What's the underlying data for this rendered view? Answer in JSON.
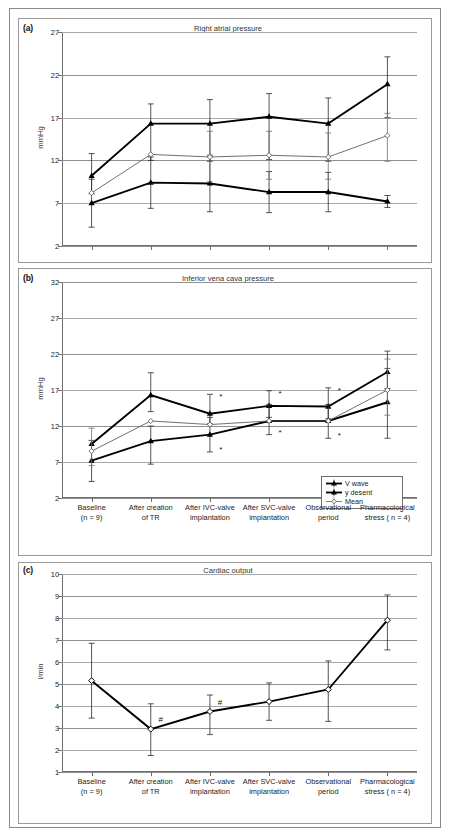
{
  "figure": {
    "panel_a_tag": "(a)",
    "panel_b_tag": "(b)",
    "panel_c_tag": "(c)"
  },
  "categories": [
    {
      "line1": "Baseline",
      "line2": "(n = 9)"
    },
    {
      "line1": "After creation",
      "line2": "of TR"
    },
    {
      "line1": "After IVC-valve",
      "line2": "implantation"
    },
    {
      "line1": "After SVC-valve",
      "line2": "implantation"
    },
    {
      "line1": "Observational",
      "line2": "period"
    },
    {
      "line1": "Pharmacological",
      "line2": "stress ( n = 4)"
    }
  ],
  "legend": {
    "items": [
      {
        "label": "V wave",
        "marker": "filled-triangle",
        "color": "#000000"
      },
      {
        "label": "y desent",
        "marker": "filled-triangle",
        "color": "#000000"
      },
      {
        "label": "Mean",
        "marker": "open-diamond",
        "color": "#555555"
      }
    ]
  },
  "chart_data": [
    {
      "type": "line",
      "panel": "a",
      "title": "Right atrial pressure",
      "xlabel": "",
      "ylabel": "mmHg",
      "ylim": [
        2,
        27
      ],
      "yticks": [
        2,
        7,
        12,
        17,
        22,
        27
      ],
      "grid": true,
      "legend_position": "none",
      "categories": [
        "Baseline (n = 9)",
        "After creation of TR",
        "After IVC-valve implantation",
        "After SVC-valve implantation",
        "Observational period",
        "Pharmacological stress ( n = 4)"
      ],
      "series": [
        {
          "name": "V wave",
          "values": [
            10.2,
            16.3,
            16.3,
            17.1,
            16.3,
            20.9
          ],
          "err_low": [
            8.1,
            12.0,
            11.9,
            12.1,
            11.9,
            17.0
          ],
          "err_high": [
            12.8,
            18.6,
            19.1,
            19.8,
            19.3,
            24.1
          ]
        },
        {
          "name": "y desent",
          "values": [
            7.0,
            9.4,
            9.3,
            8.3,
            8.3,
            7.2
          ],
          "err_low": [
            4.2,
            6.4,
            6.0,
            5.9,
            6.0,
            6.5
          ],
          "err_high": [
            9.8,
            12.4,
            12.6,
            10.7,
            10.6,
            7.9
          ]
        },
        {
          "name": "Mean",
          "values": [
            8.2,
            12.7,
            12.4,
            12.6,
            12.4,
            14.9
          ],
          "err_low": [
            8.2,
            12.7,
            9.5,
            9.8,
            9.8,
            11.9
          ],
          "err_high": [
            8.2,
            12.7,
            15.4,
            15.4,
            15.2,
            17.5
          ]
        }
      ],
      "annotations": []
    },
    {
      "type": "line",
      "panel": "b",
      "title": "Inferior vena cava pressure",
      "xlabel": "",
      "ylabel": "mmHg",
      "ylim": [
        2,
        32
      ],
      "yticks": [
        2,
        7,
        12,
        17,
        22,
        27,
        32
      ],
      "grid": true,
      "legend_position": "bottom-right",
      "categories": [
        "Baseline (n = 9)",
        "After creation of TR",
        "After IVC-valve implantation",
        "After SVC-valve implantation",
        "Observational period",
        "Pharmacological stress ( n = 4)"
      ],
      "series": [
        {
          "name": "V wave",
          "values": [
            9.5,
            16.3,
            13.7,
            14.8,
            14.7,
            19.5
          ],
          "err_low": [
            9.5,
            14.0,
            12.3,
            13.2,
            13.0,
            17.2
          ],
          "err_high": [
            9.5,
            19.4,
            16.4,
            16.9,
            17.3,
            22.4
          ]
        },
        {
          "name": "y desent",
          "values": [
            7.2,
            9.9,
            10.8,
            12.7,
            12.7,
            15.3
          ],
          "err_low": [
            4.3,
            6.7,
            8.4,
            10.8,
            10.3,
            10.3
          ],
          "err_high": [
            10.0,
            12.0,
            13.2,
            15.0,
            15.0,
            20.0
          ]
        },
        {
          "name": "Mean",
          "values": [
            8.5,
            12.7,
            12.2,
            12.7,
            12.7,
            17.0
          ],
          "err_low": [
            6.5,
            12.7,
            12.2,
            12.7,
            12.7,
            13.5
          ],
          "err_high": [
            11.7,
            12.7,
            12.2,
            12.7,
            12.7,
            21.3
          ]
        }
      ],
      "annotations": [
        {
          "symbol": "*",
          "category_index": 2,
          "position": "above"
        },
        {
          "symbol": "*",
          "category_index": 3,
          "position": "above"
        },
        {
          "symbol": "*",
          "category_index": 3,
          "position": "below"
        },
        {
          "symbol": "*",
          "category_index": 4,
          "position": "above"
        },
        {
          "symbol": "*",
          "category_index": 4,
          "position": "below"
        },
        {
          "symbol": "*",
          "category_index": 2,
          "position": "below"
        }
      ]
    },
    {
      "type": "line",
      "panel": "c",
      "title": "Cardiac output",
      "xlabel": "",
      "ylabel": "l/min",
      "ylim": [
        1,
        10
      ],
      "yticks": [
        1,
        2,
        3,
        4,
        5,
        6,
        7,
        8,
        9,
        10
      ],
      "grid": true,
      "legend_position": "none",
      "categories": [
        "Baseline (n = 9)",
        "After creation of TR",
        "After IVC-valve implantation",
        "After SVC-valve implantation",
        "Observational period",
        "Pharmacological stress ( n = 4)"
      ],
      "series": [
        {
          "name": "Cardiac output",
          "values": [
            5.15,
            2.95,
            3.75,
            4.2,
            4.75,
            7.9
          ],
          "err_low": [
            3.45,
            1.75,
            2.7,
            3.35,
            3.3,
            6.55
          ],
          "err_high": [
            6.85,
            4.1,
            4.5,
            5.05,
            6.05,
            9.05
          ]
        }
      ],
      "annotations": [
        {
          "symbol": "#",
          "category_index": 1,
          "position": "right"
        },
        {
          "symbol": "#",
          "category_index": 2,
          "position": "right"
        }
      ]
    }
  ]
}
